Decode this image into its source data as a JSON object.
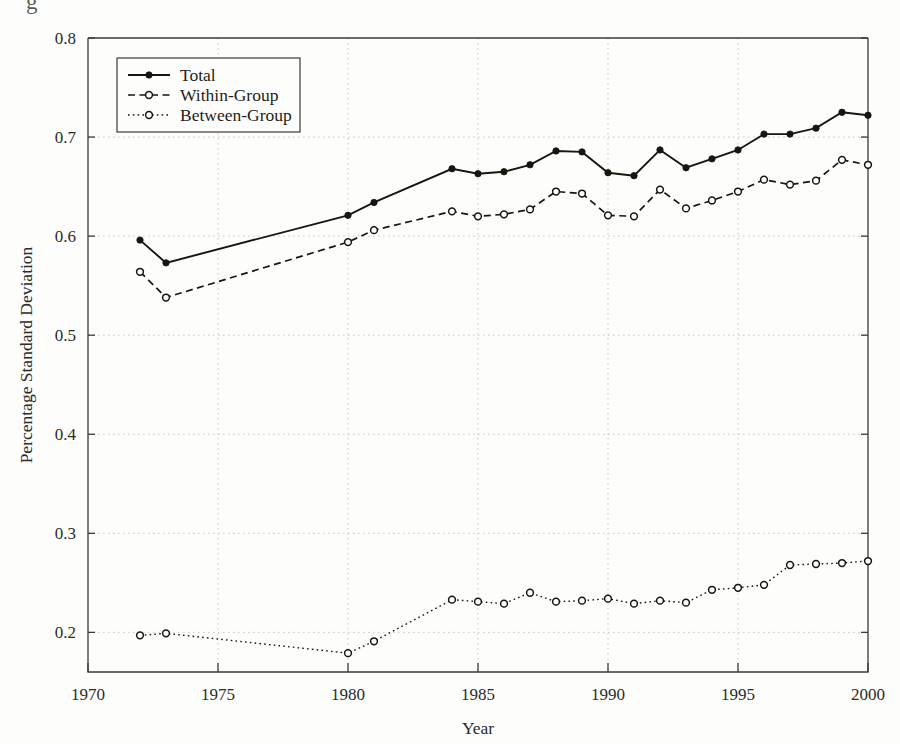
{
  "figure": {
    "background_color": "#fdfdfb",
    "ink_color": "#16160f",
    "grid_color": "#c9c9c4",
    "cropped_title_fragment": "g"
  },
  "axes": {
    "x": {
      "label": "Year",
      "min": 1970,
      "max": 2000,
      "ticks": [
        1970,
        1975,
        1980,
        1985,
        1990,
        1995,
        2000
      ],
      "tick_labels": [
        "1970",
        "1975",
        "1980",
        "1985",
        "1990",
        "1995",
        "2000"
      ]
    },
    "y": {
      "label": "Percentage Standard Deviation",
      "min": 0.16,
      "max": 0.8,
      "ticks": [
        0.2,
        0.3,
        0.4,
        0.5,
        0.6,
        0.7,
        0.8
      ],
      "tick_labels": [
        "0.2",
        "0.3",
        "0.4",
        "0.5",
        "0.6",
        "0.7",
        "0.8"
      ]
    }
  },
  "legend": {
    "position": "top-left",
    "entries": [
      {
        "label": "Total",
        "style": "solid",
        "marker": "filled-circle"
      },
      {
        "label": "Within-Group",
        "style": "dashed",
        "marker": "open-circle"
      },
      {
        "label": "Between-Group",
        "style": "dotted",
        "marker": "open-circle"
      }
    ]
  },
  "chart_data": {
    "type": "line",
    "title": "",
    "xlabel": "Year",
    "ylabel": "Percentage Standard Deviation",
    "xlim": [
      1970,
      2000
    ],
    "ylim": [
      0.16,
      0.8
    ],
    "grid": true,
    "legend_position": "top-left",
    "x": [
      1972,
      1973,
      1980,
      1981,
      1984,
      1985,
      1986,
      1987,
      1988,
      1989,
      1990,
      1991,
      1992,
      1993,
      1994,
      1995,
      1996,
      1997,
      1998,
      1999,
      2000
    ],
    "series": [
      {
        "name": "Total",
        "style": "solid",
        "marker": "filled-circle",
        "values": [
          0.596,
          0.573,
          0.621,
          0.634,
          0.668,
          0.663,
          0.665,
          0.672,
          0.686,
          0.685,
          0.664,
          0.661,
          0.687,
          0.669,
          0.678,
          0.687,
          0.703,
          0.703,
          0.709,
          0.725,
          0.722
        ]
      },
      {
        "name": "Within-Group",
        "style": "dashed",
        "marker": "open-circle",
        "values": [
          0.564,
          0.538,
          0.594,
          0.606,
          0.625,
          0.62,
          0.622,
          0.627,
          0.645,
          0.643,
          0.621,
          0.62,
          0.647,
          0.628,
          0.636,
          0.645,
          0.657,
          0.652,
          0.656,
          0.677,
          0.672
        ]
      },
      {
        "name": "Between-Group",
        "style": "dotted",
        "marker": "open-circle",
        "values": [
          0.197,
          0.199,
          0.179,
          0.191,
          0.233,
          0.231,
          0.229,
          0.24,
          0.231,
          0.232,
          0.234,
          0.229,
          0.232,
          0.23,
          0.243,
          0.245,
          0.248,
          0.268,
          0.269,
          0.27,
          0.272
        ]
      }
    ]
  }
}
